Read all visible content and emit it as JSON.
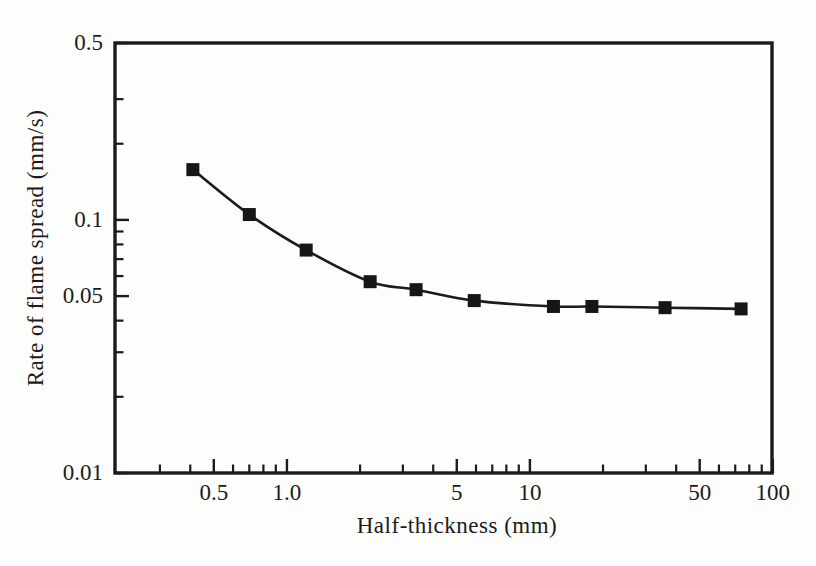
{
  "figure": {
    "background": "#fdfdfc",
    "ink_color": "#1b1b1b",
    "marker_color": "#161616"
  },
  "chart_data": {
    "type": "line",
    "title": "",
    "xlabel": "Half-thickness (mm)",
    "ylabel": "Rate of flame spread (mm/s)",
    "x_scale": "log",
    "y_scale": "log",
    "xlim": [
      0.196,
      99.2
    ],
    "ylim": [
      0.01,
      0.5
    ],
    "grid": false,
    "legend": "none",
    "marker": "filled-square",
    "series": [
      {
        "name": "flame-spread-rate",
        "points": [
          {
            "x": 0.41,
            "y": 0.158
          },
          {
            "x": 0.7,
            "y": 0.105
          },
          {
            "x": 1.2,
            "y": 0.076
          },
          {
            "x": 2.2,
            "y": 0.057
          },
          {
            "x": 3.4,
            "y": 0.053
          },
          {
            "x": 5.9,
            "y": 0.048
          },
          {
            "x": 12.5,
            "y": 0.0455
          },
          {
            "x": 18,
            "y": 0.0455
          },
          {
            "x": 36,
            "y": 0.045
          },
          {
            "x": 74,
            "y": 0.0445
          }
        ]
      }
    ],
    "x_ticks_major": [
      {
        "v": 0.5,
        "label": "0.5"
      },
      {
        "v": 1,
        "label": "1.0"
      },
      {
        "v": 5,
        "label": "5"
      },
      {
        "v": 10,
        "label": "10"
      },
      {
        "v": 50,
        "label": "50"
      },
      {
        "v": 100,
        "label": "100"
      }
    ],
    "x_ticks_minor": [
      0.3,
      0.4,
      0.6,
      0.7,
      0.8,
      0.9,
      2,
      3,
      4,
      6,
      7,
      8,
      9,
      20,
      30,
      40,
      60,
      70,
      80,
      90
    ],
    "y_ticks_major": [
      {
        "v": 0.5,
        "label": "0.5"
      },
      {
        "v": 0.1,
        "label": "0.1"
      },
      {
        "v": 0.05,
        "label": "0.05"
      },
      {
        "v": 0.01,
        "label": "0.01"
      }
    ],
    "y_ticks_minor": [
      0.3,
      0.2,
      0.09,
      0.08,
      0.07,
      0.06,
      0.04,
      0.03,
      0.02
    ]
  }
}
